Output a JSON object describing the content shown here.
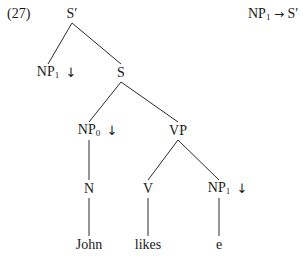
{
  "example_number": "(27)",
  "rule": {
    "lhs_base": "NP",
    "lhs_sub": "1",
    "arrow": "→",
    "rhs": "S′"
  },
  "tree": {
    "nodes": [
      {
        "id": "s_bar",
        "label": "S′",
        "sub": "",
        "subst": false,
        "x": 72,
        "y": 14
      },
      {
        "id": "np1_top",
        "label": "NP",
        "sub": "1",
        "subst": true,
        "x": 48,
        "y": 73
      },
      {
        "id": "s",
        "label": "S",
        "sub": "",
        "subst": false,
        "x": 121,
        "y": 73
      },
      {
        "id": "np0",
        "label": "NP",
        "sub": "0",
        "subst": true,
        "x": 89,
        "y": 131
      },
      {
        "id": "vp",
        "label": "VP",
        "sub": "",
        "subst": false,
        "x": 178,
        "y": 131
      },
      {
        "id": "n",
        "label": "N",
        "sub": "",
        "subst": false,
        "x": 89,
        "y": 189
      },
      {
        "id": "v",
        "label": "V",
        "sub": "",
        "subst": false,
        "x": 148,
        "y": 189
      },
      {
        "id": "np1_obj",
        "label": "NP",
        "sub": "1",
        "subst": true,
        "x": 219,
        "y": 189
      },
      {
        "id": "john",
        "label": "John",
        "sub": "",
        "subst": false,
        "x": 89,
        "y": 245
      },
      {
        "id": "likes",
        "label": "likes",
        "sub": "",
        "subst": false,
        "x": 148,
        "y": 245
      },
      {
        "id": "e",
        "label": "e",
        "sub": "",
        "subst": false,
        "x": 219,
        "y": 245
      }
    ],
    "edges": [
      [
        "s_bar",
        "np1_top"
      ],
      [
        "s_bar",
        "s"
      ],
      [
        "s",
        "np0"
      ],
      [
        "s",
        "vp"
      ],
      [
        "np0",
        "n"
      ],
      [
        "vp",
        "v"
      ],
      [
        "vp",
        "np1_obj"
      ],
      [
        "n",
        "john"
      ],
      [
        "v",
        "likes"
      ],
      [
        "np1_obj",
        "e"
      ]
    ],
    "substitution_marker": "↓"
  }
}
